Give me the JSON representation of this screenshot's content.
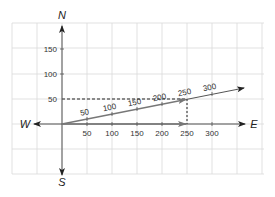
{
  "diagram": {
    "type": "vector-compass-diagram",
    "directions": {
      "north": "N",
      "south": "S",
      "east": "E",
      "west": "W"
    },
    "x_axis_ticks": [
      "50",
      "100",
      "150",
      "200",
      "250",
      "300"
    ],
    "y_axis_ticks": [
      "50",
      "100",
      "150"
    ],
    "resultant_vector_ticks": [
      "50",
      "100",
      "150",
      "200",
      "250",
      "300"
    ],
    "components": {
      "east_component": 250,
      "north_component": 50
    },
    "colors": {
      "grid": "#d9d9d9",
      "axis": "#555555",
      "vector": "#666666",
      "arrowhead": "#222222",
      "dashed": "#222222"
    }
  }
}
